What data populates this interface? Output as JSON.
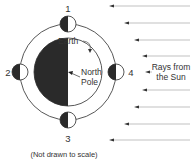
{
  "diagram": {
    "labels": {
      "earth": "Earth",
      "north_pole_line1": "North",
      "north_pole_line2": "Pole",
      "rays_line1": "Rays from",
      "rays_line2": "the Sun",
      "caption": "(Not drawn to scale)"
    },
    "moons": [
      {
        "id": "1",
        "label": "1"
      },
      {
        "id": "2",
        "label": "2"
      },
      {
        "id": "3",
        "label": "3"
      },
      {
        "id": "4",
        "label": "4"
      }
    ],
    "colors": {
      "dark_side": "#2a2a2a",
      "lit_side": "#ffffff",
      "line": "#444444",
      "ray": "#888888"
    }
  }
}
